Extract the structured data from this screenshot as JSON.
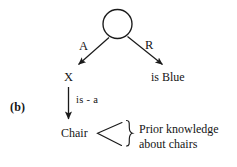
{
  "figure": {
    "panel_label": "(b)",
    "background_color": "#ffffff",
    "ink_color": "#1a1a1a",
    "width": 237,
    "height": 167
  },
  "graph": {
    "root_node": {
      "name": "unlabeled-circle-node",
      "label": "",
      "shape": "circle",
      "cx": 117.5,
      "cy": 24,
      "r": 14.5
    },
    "edges": [
      {
        "id": "edge-a",
        "label": "A",
        "from": "root",
        "to": "X",
        "x1": 108,
        "y1": 37,
        "x2": 78,
        "y2": 65
      },
      {
        "id": "edge-r",
        "label": "R",
        "from": "root",
        "to": "is Blue",
        "x1": 128,
        "y1": 36,
        "x2": 163,
        "y2": 65
      },
      {
        "id": "edge-is-a",
        "label": "is - a",
        "from": "X",
        "to": "Chair",
        "x1": 68,
        "y1": 88,
        "x2": 68,
        "y2": 120
      }
    ],
    "nodes": [
      {
        "id": "node-x",
        "label": "X"
      },
      {
        "id": "node-is-blue",
        "label": "is Blue"
      },
      {
        "id": "node-chair",
        "label": "Chair"
      }
    ]
  },
  "annotation": {
    "name": "prior-knowledge-annotation",
    "fan_marker": "<",
    "brace": "}",
    "lines": [
      "Prior knowledge",
      "about chairs"
    ]
  }
}
